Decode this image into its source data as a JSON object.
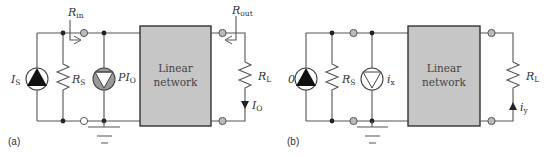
{
  "panels": [
    {
      "caption": "(a)",
      "source_label": "I",
      "source_sub": "S",
      "shunt_resistor_label": "R",
      "shunt_resistor_sub": "S",
      "dependent_source_label": "PI",
      "dependent_source_sub": "O",
      "rin_label": "R",
      "rin_sub": "in",
      "network_line1": "Linear",
      "network_line2": "network",
      "rout_label": "R",
      "rout_sub": "out",
      "load_label": "R",
      "load_sub": "L",
      "output_current_label": "I",
      "output_current_sub": "O"
    },
    {
      "caption": "(b)",
      "source_label": "0",
      "shunt_resistor_label": "R",
      "shunt_resistor_sub": "S",
      "test_source_label": "i",
      "test_source_sub": "x",
      "network_line1": "Linear",
      "network_line2": "network",
      "load_label": "R",
      "load_sub": "L",
      "response_current_label": "i",
      "response_current_sub": "y"
    }
  ],
  "colors": {
    "wire": "#555555",
    "network_fill": "#c6c6c6",
    "terminal_fill": "#bbbbbb",
    "node": "#222222"
  }
}
